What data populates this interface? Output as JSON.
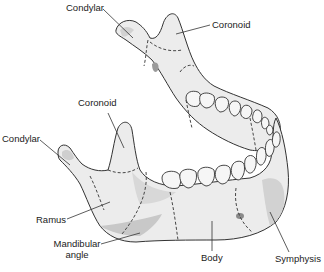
{
  "figure": {
    "colors": {
      "bone_fill": "#ececec",
      "bone_shadow": "#cfcfcf",
      "outline": "#333333",
      "tooth_fill": "#f6f6f6",
      "label_text": "#222222"
    }
  },
  "labels": {
    "condylar_top": "Condylar",
    "coronoid_top": "Coronoid",
    "coronoid_mid": "Coronoid",
    "condylar_left": "Condylar",
    "ramus": "Ramus",
    "mandibular_angle_line1": "Mandibular",
    "mandibular_angle_line2": "angle",
    "body": "Body",
    "symphysis": "Symphysis"
  }
}
